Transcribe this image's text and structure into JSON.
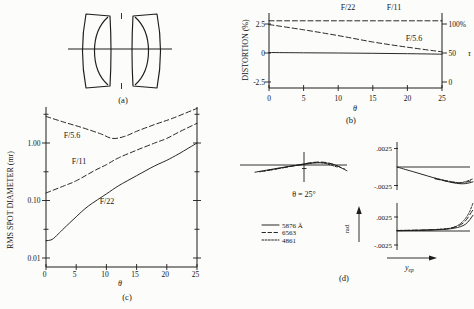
{
  "panel_a": {
    "caption": "(a)"
  },
  "panel_b": {
    "caption": "(b)",
    "y_axis_label": "DISTORTION (%)",
    "y_ticks": [
      "2.5",
      "0",
      "-2.5"
    ],
    "x_ticks": [
      "0",
      "5",
      "10",
      "15",
      "20",
      "25"
    ],
    "x_axis_label": "θ",
    "right_ticks": [
      "100%",
      "50",
      "0"
    ],
    "right_axis_label": "τ",
    "curve_labels": {
      "f22": "F/22",
      "f11": "F/11",
      "f56": "F/5.6"
    }
  },
  "panel_c": {
    "caption": "(c)",
    "y_axis_label": "RMS SPOT DIAMETER (mr)",
    "y_ticks": [
      "1.00",
      "0.10",
      "0.01"
    ],
    "x_ticks": [
      "0",
      "5",
      "10",
      "15",
      "20",
      "25"
    ],
    "x_axis_label": "θ",
    "curve_labels": {
      "f56": "F/5.6",
      "f11": "F/11",
      "f22": "F/22"
    }
  },
  "panel_d": {
    "caption": "(d)",
    "field_angle_label": "θ = 25°",
    "scale_pos": ".0025",
    "scale_neg": "-.0025",
    "rad_axis_label": "rad",
    "pupil_axis_label": "y",
    "pupil_axis_sub": "ep",
    "legend": [
      {
        "label": "5876 Å",
        "style": "solid"
      },
      {
        "label": "6563",
        "style": "dashed"
      },
      {
        "label": "4861",
        "style": "dotted"
      }
    ]
  },
  "chart_data": [
    {
      "id": "panel_b_distortion_and_vignetting",
      "type": "line",
      "xlabel": "θ",
      "x_range": [
        0,
        25
      ],
      "x_ticks": [
        0,
        5,
        10,
        15,
        20,
        25
      ],
      "left_axis": {
        "label": "DISTORTION (%)",
        "ticks": [
          2.5,
          0,
          -2.5
        ]
      },
      "right_axis": {
        "label": "τ",
        "ticks_percent": [
          100,
          50,
          0
        ]
      },
      "series": [
        {
          "name": "distortion",
          "style": "solid",
          "x": [
            0,
            5,
            10,
            15,
            20,
            25
          ],
          "y_percent": [
            0.04,
            0.02,
            0,
            -0.03,
            -0.06,
            -0.1
          ]
        },
        {
          "name": "tau F/22 and F/11 (100%)",
          "style": "dashed",
          "x": [
            0,
            25
          ],
          "y_percent": [
            2.78,
            2.78
          ]
        },
        {
          "name": "tau F/5.6",
          "style": "dashed",
          "x": [
            0,
            5,
            10,
            15,
            20,
            25
          ],
          "y_percent": [
            2.45,
            2.0,
            1.5,
            0.95,
            0.5,
            0.1
          ]
        }
      ]
    },
    {
      "id": "panel_c_rms_spot_diameter",
      "type": "line",
      "xlabel": "θ",
      "ylabel": "RMS SPOT DIAMETER (mr)",
      "x_range": [
        0,
        25
      ],
      "x_ticks": [
        0,
        5,
        10,
        15,
        20,
        25
      ],
      "y_scale": "log",
      "y_ticks": [
        1.0,
        0.1,
        0.01
      ],
      "y_minor_ticks": [
        3.16,
        0.316,
        0.0316
      ],
      "series": [
        {
          "name": "F/5.6",
          "style": "dashed",
          "x": [
            0,
            3,
            6,
            9,
            11,
            13,
            15,
            18,
            21,
            25
          ],
          "y_mr": [
            2.9,
            2.3,
            1.85,
            1.45,
            1.2,
            1.3,
            1.6,
            2.1,
            2.7,
            4.0
          ]
        },
        {
          "name": "F/11",
          "style": "dashed",
          "x": [
            0,
            3,
            5,
            8,
            10,
            12,
            15,
            18,
            20,
            22,
            25
          ],
          "y_mr": [
            0.135,
            0.18,
            0.22,
            0.33,
            0.42,
            0.55,
            0.75,
            1.0,
            1.2,
            1.55,
            2.2
          ]
        },
        {
          "name": "F/22",
          "style": "solid",
          "x": [
            0,
            1,
            2,
            3,
            5,
            7,
            10,
            12,
            15,
            18,
            20,
            22,
            25
          ],
          "y_mr": [
            0.02,
            0.021,
            0.026,
            0.033,
            0.052,
            0.08,
            0.13,
            0.18,
            0.27,
            0.4,
            0.5,
            0.65,
            1.0
          ]
        }
      ]
    },
    {
      "id": "panel_d_ray_aberration_fans",
      "type": "line",
      "field_angle_deg": 25,
      "y_unit": "rad",
      "x_unit": "y_ep (normalized pupil coordinate)",
      "scale_marks_rad": [
        0.0025,
        -0.0025
      ],
      "wavelengths_angstrom": [
        5876,
        6563,
        4861
      ],
      "subplots": [
        {
          "name": "tangential fan, θ = 25°",
          "series": [
            {
              "wavelength": "5876 Å",
              "style": "solid",
              "x": [
                -1,
                -0.75,
                -0.5,
                -0.25,
                0,
                0.25,
                0.45,
                0.7,
                1
              ],
              "y_rad": [
                -0.001,
                -0.00072,
                -0.00045,
                -0.00018,
                2e-05,
                0.00025,
                0.0003,
                0.0001,
                -0.0008
              ]
            },
            {
              "wavelength": "6563",
              "style": "dashed",
              "x": [
                -0.9,
                -0.5,
                -0.1,
                0.3,
                0.6,
                0.95
              ],
              "y_rad": [
                -0.00095,
                -0.0005,
                -5e-05,
                0.00038,
                0.00028,
                -0.00055
              ]
            },
            {
              "wavelength": "4861",
              "style": "dotted",
              "x": [
                -0.8,
                -0.4,
                0,
                0.4,
                0.8
              ],
              "y_rad": [
                -0.00085,
                -0.0004,
                8e-05,
                0.00035,
                -0.0003
              ]
            }
          ]
        },
        {
          "name": "upper right fan",
          "series": [
            {
              "wavelength": "5876 Å",
              "style": "solid",
              "x": [
                0,
                0.2,
                0.4,
                0.6,
                0.78,
                0.9,
                1
              ],
              "y_rad": [
                0,
                -0.0006,
                -0.0012,
                -0.0018,
                -0.0022,
                -0.00225,
                -0.002
              ]
            },
            {
              "wavelength": "6563",
              "style": "dashed",
              "x": [
                0.5,
                0.7,
                0.85,
                1
              ],
              "y_rad": [
                -0.0016,
                -0.002,
                -0.00215,
                -0.0018
              ]
            },
            {
              "wavelength": "4861",
              "style": "dotted",
              "x": [
                0.5,
                0.7,
                0.85,
                1
              ],
              "y_rad": [
                -0.0015,
                -0.00195,
                -0.0021,
                -0.0016
              ]
            }
          ]
        },
        {
          "name": "lower right fan",
          "series": [
            {
              "wavelength": "5876 Å",
              "style": "solid",
              "x": [
                0,
                0.5,
                0.75,
                0.9,
                1
              ],
              "y_rad": [
                5e-05,
                0.0002,
                0.0005,
                0.0012,
                0.0028
              ]
            },
            {
              "wavelength": "6563",
              "style": "dashed",
              "x": [
                0,
                0.4,
                0.65,
                0.8,
                0.9,
                1
              ],
              "y_rad": [
                8e-05,
                0.0002,
                0.0004,
                0.0009,
                0.0018,
                0.0038
              ]
            },
            {
              "wavelength": "4861",
              "style": "dotted",
              "x": [
                0,
                0.3,
                0.55,
                0.7,
                0.8,
                0.88,
                0.95,
                1
              ],
              "y_rad": [
                0.0001,
                0.00015,
                0.0003,
                0.0005,
                0.001,
                0.0019,
                0.0033,
                0.005
              ]
            }
          ]
        }
      ]
    }
  ]
}
